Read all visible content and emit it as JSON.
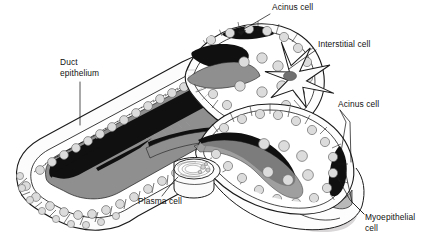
{
  "figure": {
    "type": "histology-diagram",
    "background_color": "#ffffff",
    "ink_color": "#111111",
    "palette": {
      "outline": "#1a1a1a",
      "lumen_dark": "#101010",
      "lumen_gray": "#8f8f8f",
      "cell_fill": "#fafafa",
      "nucleus_fill": "#dcdcdc",
      "nucleus_stroke": "#6a6a6a",
      "basement_gray": "#b9b9b9",
      "shadow_gray": "#d4d4d4",
      "interstitial_nucleus": "#707070"
    }
  },
  "labels": [
    {
      "id": "acinus-cell-top",
      "text": "Acinus cell",
      "x": 272,
      "y": 3,
      "align": "left",
      "leader": [
        [
          270,
          14
        ],
        [
          253,
          24
        ],
        [
          240,
          31
        ]
      ]
    },
    {
      "id": "interstitial-cell",
      "text": "Interstitial cell",
      "x": 318,
      "y": 40,
      "align": "left",
      "leader": [
        [
          317,
          51
        ],
        [
          300,
          62
        ],
        [
          288,
          70
        ]
      ]
    },
    {
      "id": "acinus-cell-right",
      "text": "Acinus cell",
      "x": 338,
      "y": 100,
      "align": "left",
      "leader": [
        [
          340,
          111
        ],
        [
          352,
          124
        ],
        [
          352,
          188
        ]
      ]
    },
    {
      "id": "duct-epithelium",
      "text": "Duct\nepithelium",
      "x": 61,
      "y": 58,
      "align": "left",
      "leader": [
        [
          80,
          82
        ],
        [
          80,
          124
        ]
      ]
    },
    {
      "id": "plasma-cell",
      "text": "Plasma cell",
      "x": 138,
      "y": 197,
      "align": "left",
      "leader": [
        [
          160,
          196
        ],
        [
          172,
          182
        ],
        [
          178,
          176
        ]
      ]
    },
    {
      "id": "myoepithelial-cell",
      "text": "Myoepithelial\ncell",
      "x": 366,
      "y": 213,
      "align": "left",
      "leader": [
        [
          365,
          220
        ],
        [
          352,
          206
        ],
        [
          349,
          165
        ]
      ]
    }
  ],
  "structures": {
    "duct": {
      "name": "Duct with stratified epithelium",
      "lumen_color": "#101010",
      "secretion_color": "#8f8f8f"
    },
    "acinus_upper": {
      "name": "Upper acinus",
      "cell_count": 18
    },
    "acinus_lower": {
      "name": "Lower right acinus",
      "cell_count": 22
    },
    "interstitial_cell": {
      "name": "Stellate interstitial cell",
      "processes": 5
    },
    "plasma_cell": {
      "name": "Plasma cell (free, cut-away disc)"
    },
    "myoepithelial_cell": {
      "name": "Myoepithelial cell (dark spindle)"
    }
  }
}
